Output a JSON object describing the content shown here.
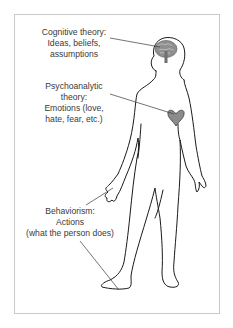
{
  "diagram": {
    "labels": {
      "cognitive": {
        "lines": [
          "Cognitive theory:",
          "Ideas, beliefs,",
          "assumptions"
        ],
        "target": "brain"
      },
      "psychoanalytic": {
        "lines": [
          "Psychoanalytic",
          "theory:",
          "Emotions (love,",
          "hate, fear, etc.)"
        ],
        "target": "heart"
      },
      "behaviorism": {
        "lines": [
          "Behaviorism:",
          "Actions",
          "(what the person does)"
        ],
        "target": "hand and foot"
      }
    },
    "colors": {
      "outline": "#1a1a1a",
      "brain": "#8a8a8a",
      "heart": "#8c8c8c",
      "text": "#3a3a3a",
      "border": "#c9c9c9"
    }
  }
}
